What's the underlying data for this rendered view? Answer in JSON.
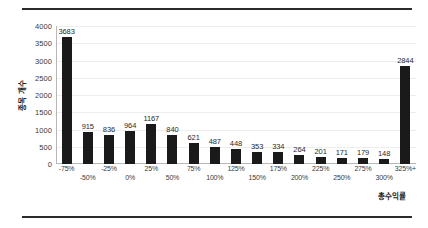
{
  "chart_data": {
    "type": "bar",
    "title": "",
    "xlabel": "총수익률",
    "ylabel": "종목 개수",
    "ylim": [
      0,
      4000
    ],
    "y_ticks": [
      4000,
      3500,
      3000,
      2500,
      2000,
      1500,
      1000,
      500,
      0
    ],
    "grid": true,
    "legend": null,
    "bar_color": "#1a1a1a",
    "categories": [
      "-75%",
      "-50%",
      "-25%",
      "0%",
      "25%",
      "50%",
      "75%",
      "100%",
      "125%",
      "150%",
      "175%",
      "200%",
      "225%",
      "250%",
      "275%",
      "300%",
      "325%+"
    ],
    "values": [
      3683,
      915,
      836,
      964,
      1167,
      840,
      621,
      487,
      448,
      353,
      334,
      264,
      201,
      171,
      179,
      148,
      2844
    ],
    "data_labels": [
      "3683",
      "915",
      "836",
      "964",
      "1167",
      "840",
      "621",
      "487",
      "448",
      "353",
      "334",
      "264",
      "201",
      "171",
      "179",
      "148",
      "2844"
    ]
  },
  "figure": {
    "rule_color": "#2b2b2b",
    "background": "#ffffff"
  }
}
